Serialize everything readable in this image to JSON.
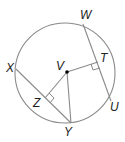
{
  "diagram": {
    "type": "circle-geometry",
    "center_label": "V",
    "points": {
      "W": "W",
      "T": "T",
      "U": "U",
      "V": "V",
      "X": "X",
      "Z": "Z",
      "Y": "Y"
    },
    "segments": [
      "WU",
      "XY",
      "VT",
      "VZ",
      "VY"
    ],
    "right_angles": [
      "VTW",
      "VZY"
    ],
    "colors": {
      "stroke": "#8a8a8a",
      "text": "#222222",
      "center_dot": "#000000"
    }
  }
}
